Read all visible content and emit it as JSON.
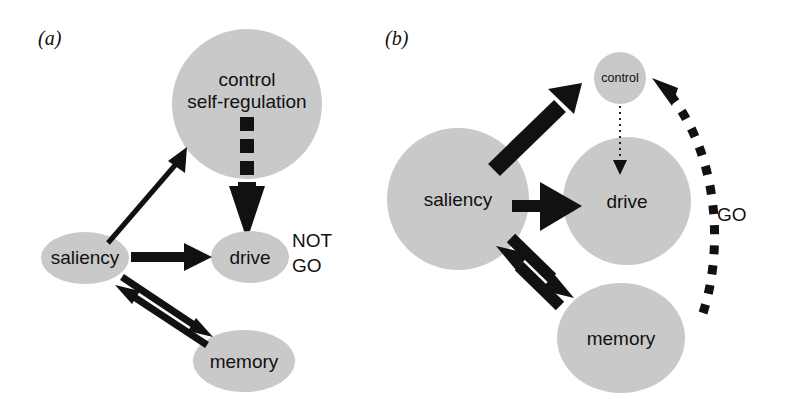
{
  "figure": {
    "width": 788,
    "height": 407,
    "background": "#ffffff",
    "node_fill": "#c9c9c9",
    "ink_color": "#111111"
  },
  "panels": [
    {
      "id": "a",
      "label": "(a)",
      "nodes": [
        {
          "id": "control_a",
          "label_line1": "control",
          "label_line2": "self-regulation",
          "shape": "circle"
        },
        {
          "id": "saliency_a",
          "label": "saliency",
          "shape": "ellipse"
        },
        {
          "id": "drive_a",
          "label": "drive",
          "shape": "ellipse"
        },
        {
          "id": "memory_a",
          "label": "memory",
          "shape": "ellipse"
        }
      ],
      "annotations": [
        {
          "id": "notgo",
          "line1": "NOT",
          "line2": "GO"
        }
      ],
      "edges": [
        {
          "from": "saliency",
          "to": "control",
          "style": "solid-thin-arrow"
        },
        {
          "from": "saliency",
          "to": "drive",
          "style": "solid-thick-arrow"
        },
        {
          "from": "saliency",
          "to": "memory",
          "style": "solid-thick-arrow"
        },
        {
          "from": "memory",
          "to": "saliency",
          "style": "solid-thick-arrow"
        },
        {
          "from": "control",
          "to": "drive",
          "style": "dashed-block-arrow"
        }
      ]
    },
    {
      "id": "b",
      "label": "(b)",
      "nodes": [
        {
          "id": "control_b",
          "label": "control",
          "shape": "circle"
        },
        {
          "id": "saliency_b",
          "label": "saliency",
          "shape": "circle"
        },
        {
          "id": "drive_b",
          "label": "drive",
          "shape": "circle"
        },
        {
          "id": "memory_b",
          "label": "memory",
          "shape": "ellipse"
        }
      ],
      "annotations": [
        {
          "id": "go",
          "text": "GO"
        }
      ],
      "edges": [
        {
          "from": "saliency",
          "to": "control",
          "style": "solid-very-thick-arrow"
        },
        {
          "from": "saliency",
          "to": "drive",
          "style": "solid-thick-arrow"
        },
        {
          "from": "saliency",
          "to": "memory",
          "style": "solid-thick-arrow"
        },
        {
          "from": "memory",
          "to": "saliency",
          "style": "solid-thick-arrow"
        },
        {
          "from": "control",
          "to": "drive",
          "style": "dotted-thin-arrow"
        },
        {
          "from": "memory",
          "to": "control",
          "style": "dashed-curve-arrow"
        }
      ]
    }
  ]
}
